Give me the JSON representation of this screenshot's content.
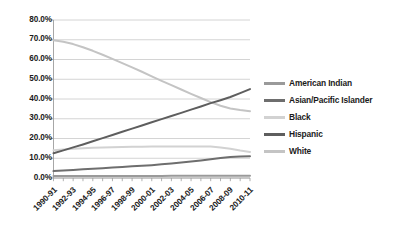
{
  "chart_data": {
    "type": "line",
    "title": "",
    "xlabel": "",
    "ylabel": "",
    "ylim": [
      0,
      80
    ],
    "ytick_labels": [
      "80.0%",
      "70.0%",
      "60.0%",
      "50.0%",
      "40.0%",
      "30.0%",
      "20.0%",
      "10.0%",
      "0.0%"
    ],
    "ytick_values": [
      80,
      70,
      60,
      50,
      40,
      30,
      20,
      10,
      0
    ],
    "grid": true,
    "legend_position": "right",
    "categories": [
      "1990-91",
      "1991-92",
      "1992-93",
      "1993-94",
      "1994-95",
      "1995-96",
      "1996-97",
      "1997-98",
      "1998-99",
      "1999-00",
      "2000-01",
      "2001-02",
      "2002-03",
      "2003-04",
      "2004-05",
      "2005-06",
      "2006-07",
      "2007-08",
      "2008-09",
      "2009-10",
      "2010-11"
    ],
    "tick_labels": [
      "1990-91",
      "1992-93",
      "1994-95",
      "1996-97",
      "1998-99",
      "2000-01",
      "2002-03",
      "2004-05",
      "2006-07",
      "2008-09",
      "2010-11"
    ],
    "series": [
      {
        "name": "American Indian",
        "color": "#9a9a9a",
        "values": [
          1.0,
          1.0,
          1.0,
          1.0,
          1.0,
          1.0,
          1.0,
          1.0,
          1.0,
          1.0,
          1.0,
          1.0,
          1.1,
          1.1,
          1.1,
          1.2,
          1.2,
          1.2,
          1.2,
          1.2,
          1.2
        ]
      },
      {
        "name": "Asian/Pacific Islander",
        "color": "#6e6e6e",
        "values": [
          3.5,
          3.8,
          4.1,
          4.4,
          4.7,
          5.0,
          5.3,
          5.6,
          5.9,
          6.2,
          6.5,
          6.9,
          7.3,
          7.8,
          8.3,
          8.9,
          9.5,
          10.1,
          10.6,
          10.9,
          11.0
        ]
      },
      {
        "name": "Black",
        "color": "#d2d2d2",
        "values": [
          14.0,
          14.4,
          14.8,
          15.1,
          15.3,
          15.5,
          15.6,
          15.7,
          15.8,
          15.8,
          15.9,
          15.9,
          16.0,
          16.0,
          16.0,
          16.0,
          15.9,
          15.5,
          14.8,
          13.9,
          13.2
        ]
      },
      {
        "name": "Hispanic",
        "color": "#5e5e5e",
        "values": [
          12.5,
          14.0,
          15.5,
          17.0,
          18.6,
          20.2,
          21.8,
          23.4,
          25.0,
          26.6,
          28.2,
          29.8,
          31.4,
          33.0,
          34.6,
          36.2,
          37.9,
          39.4,
          41.0,
          43.0,
          45.0
        ]
      },
      {
        "name": "White",
        "color": "#c4c4c4",
        "values": [
          69.8,
          69.0,
          67.8,
          66.2,
          64.4,
          62.4,
          60.3,
          58.2,
          56.0,
          53.8,
          51.5,
          49.2,
          47.0,
          44.8,
          42.6,
          40.5,
          38.4,
          36.6,
          35.2,
          34.4,
          33.8
        ]
      }
    ]
  },
  "legend": {
    "items": [
      {
        "label": "American Indian"
      },
      {
        "label": "Asian/Pacific Islander"
      },
      {
        "label": "Black"
      },
      {
        "label": "Hispanic"
      },
      {
        "label": "White"
      }
    ]
  },
  "colors": {
    "axis": "#9d9d9d",
    "grid": "#c9c9c9",
    "text": "#1b1b1b",
    "background": "#ffffff"
  }
}
